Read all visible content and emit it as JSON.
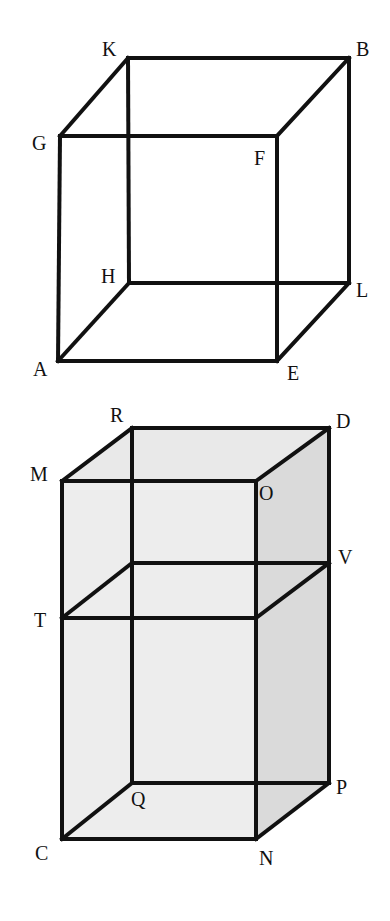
{
  "figures": [
    {
      "name": "cube-top",
      "vertices": {
        "K": [
          128,
          58
        ],
        "B": [
          349,
          58
        ],
        "G": [
          60,
          136
        ],
        "F": [
          277,
          136
        ],
        "H": [
          129,
          283
        ],
        "L": [
          349,
          283
        ],
        "A": [
          58,
          361
        ],
        "E": [
          277,
          361
        ]
      },
      "labels": [
        {
          "text": "K",
          "x": 102,
          "y": 56
        },
        {
          "text": "B",
          "x": 356,
          "y": 56
        },
        {
          "text": "G",
          "x": 32,
          "y": 150
        },
        {
          "text": "F",
          "x": 254,
          "y": 165
        },
        {
          "text": "H",
          "x": 101,
          "y": 283
        },
        {
          "text": "L",
          "x": 356,
          "y": 297
        },
        {
          "text": "A",
          "x": 33,
          "y": 376
        },
        {
          "text": "E",
          "x": 287,
          "y": 380
        }
      ],
      "faces": [],
      "edges": [
        [
          "K",
          "B"
        ],
        [
          "G",
          "F"
        ],
        [
          "H",
          "L"
        ],
        [
          "A",
          "E"
        ],
        [
          "K",
          "G"
        ],
        [
          "B",
          "F"
        ],
        [
          "H",
          "A"
        ],
        [
          "L",
          "E"
        ],
        [
          "K",
          "H"
        ],
        [
          "B",
          "L"
        ],
        [
          "G",
          "A"
        ],
        [
          "F",
          "E"
        ]
      ]
    },
    {
      "name": "prism-bottom",
      "vertices": {
        "R": [
          132,
          428
        ],
        "D": [
          329,
          428
        ],
        "M": [
          62,
          481
        ],
        "O": [
          256,
          481
        ],
        "X1": [
          132,
          563
        ],
        "V": [
          329,
          563
        ],
        "T": [
          62,
          618
        ],
        "X2": [
          256,
          618
        ],
        "Q": [
          132,
          783
        ],
        "P": [
          329,
          783
        ],
        "C": [
          62,
          839
        ],
        "N": [
          256,
          839
        ]
      },
      "labels": [
        {
          "text": "R",
          "x": 110,
          "y": 422
        },
        {
          "text": "D",
          "x": 336,
          "y": 428
        },
        {
          "text": "M",
          "x": 30,
          "y": 481
        },
        {
          "text": "O",
          "x": 259,
          "y": 500
        },
        {
          "text": "V",
          "x": 338,
          "y": 564
        },
        {
          "text": "T",
          "x": 34,
          "y": 627
        },
        {
          "text": "Q",
          "x": 131,
          "y": 806
        },
        {
          "text": "P",
          "x": 336,
          "y": 794
        },
        {
          "text": "C",
          "x": 35,
          "y": 860
        },
        {
          "text": "N",
          "x": 259,
          "y": 865
        }
      ],
      "faces": [
        {
          "points": [
            "M",
            "O",
            "N",
            "C"
          ],
          "fill": "#ededed"
        },
        {
          "points": [
            "M",
            "R",
            "D",
            "O"
          ],
          "fill": "#e9e9e9"
        },
        {
          "points": [
            "O",
            "D",
            "P",
            "N"
          ],
          "fill": "#dadada"
        }
      ],
      "edges": [
        [
          "R",
          "D"
        ],
        [
          "M",
          "O"
        ],
        [
          "M",
          "R"
        ],
        [
          "O",
          "D"
        ],
        [
          "X1",
          "V"
        ],
        [
          "T",
          "X2"
        ],
        [
          "T",
          "X1"
        ],
        [
          "X2",
          "V"
        ],
        [
          "Q",
          "P"
        ],
        [
          "C",
          "N"
        ],
        [
          "C",
          "Q"
        ],
        [
          "N",
          "P"
        ],
        [
          "M",
          "C"
        ],
        [
          "O",
          "N"
        ],
        [
          "R",
          "Q"
        ],
        [
          "D",
          "P"
        ]
      ]
    }
  ],
  "colors": {
    "stroke": "#111111",
    "background": "#ffffff"
  }
}
